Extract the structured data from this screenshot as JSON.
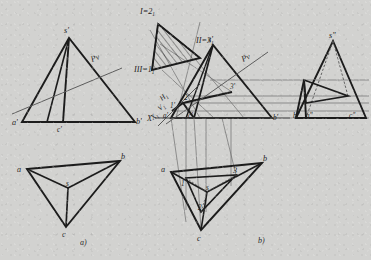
{
  "page": {
    "background_color": "#d2d2d0",
    "ink_color": "#1c1c1c",
    "thin_line_color": "#6e6e6e",
    "width": 371,
    "height": 260
  },
  "captions": {
    "left": "a)",
    "right": "b)"
  },
  "figure_a": {
    "name": "two-view-projection-without-section",
    "front_view": {
      "labels": {
        "apex": "s'",
        "left_base": "a'",
        "right_base": "b'",
        "inner_base": "c'",
        "plane_trace": "Pv"
      }
    },
    "top_view": {
      "labels": {
        "vertex_a": "a",
        "vertex_b": "b",
        "vertex_c": "c",
        "center": "s"
      }
    }
  },
  "figure_b": {
    "name": "three-view-projection-with-auxiliary-plane",
    "auxiliary_view": {
      "labels": {
        "top_vertex": "I=2",
        "top_vertex_sub": "1",
        "right_vertex": "II=3",
        "right_vertex_sub": "1",
        "left_vertex": "III=1",
        "left_vertex_sub": "1"
      }
    },
    "front_view": {
      "labels": {
        "apex": "s'",
        "left_base": "a'",
        "right_base": "b'",
        "inner_base": "c'",
        "section_1": "1'",
        "section_2": "2'",
        "section_3": "3'",
        "plane_trace": "Pv",
        "axis_x": "X",
        "axis_x1": "X",
        "axis_x1_sub": "1",
        "ground_line_h": "H",
        "ground_line_h_sub": "1",
        "ground_line_v": "V",
        "ground_line_v_sub": "1"
      }
    },
    "side_view": {
      "labels": {
        "apex": "s\"",
        "left_base": "b\"",
        "mid_base": "a\"",
        "right_base": "c\""
      }
    },
    "top_view": {
      "labels": {
        "vertex_a": "a",
        "vertex_b": "b",
        "vertex_c": "c",
        "center": "s",
        "section_1": "1",
        "section_2": "2",
        "section_3": "3"
      }
    }
  }
}
